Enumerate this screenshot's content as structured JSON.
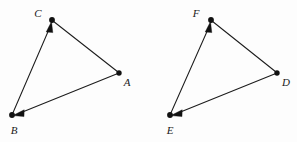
{
  "figure": {
    "background_color": "#fdfdfd",
    "stroke_color": "#1c1c1c",
    "label_color": "#1a1a1a",
    "width": 297,
    "height": 142
  },
  "triangles": [
    {
      "name": "triangle-abc",
      "vertices": [
        {
          "id": "A",
          "label": "A",
          "x": 119,
          "y": 73,
          "label_x": 127,
          "label_y": 82
        },
        {
          "id": "B",
          "label": "B",
          "x": 12,
          "y": 115,
          "label_x": 14,
          "label_y": 130
        },
        {
          "id": "C",
          "label": "C",
          "x": 52,
          "y": 20,
          "label_x": 38,
          "label_y": 13
        }
      ],
      "edges": [
        {
          "name": "edge-b-to-c",
          "from": "B",
          "to": "C",
          "arrow_at": "C"
        },
        {
          "name": "edge-c-to-a",
          "from": "C",
          "to": "A",
          "arrow_at": "none"
        },
        {
          "name": "edge-a-to-b",
          "from": "A",
          "to": "B",
          "arrow_at": "B"
        }
      ]
    },
    {
      "name": "triangle-def",
      "vertices": [
        {
          "id": "D",
          "label": "D",
          "x": 277,
          "y": 73,
          "label_x": 286,
          "label_y": 82
        },
        {
          "id": "E",
          "label": "E",
          "x": 170,
          "y": 115,
          "label_x": 170,
          "label_y": 130
        },
        {
          "id": "F",
          "label": "F",
          "x": 211,
          "y": 20,
          "label_x": 196,
          "label_y": 13
        }
      ],
      "edges": [
        {
          "name": "edge-e-to-f",
          "from": "E",
          "to": "F",
          "arrow_at": "F"
        },
        {
          "name": "edge-f-to-d",
          "from": "F",
          "to": "D",
          "arrow_at": "none"
        },
        {
          "name": "edge-d-to-e",
          "from": "D",
          "to": "E",
          "arrow_at": "E"
        }
      ]
    }
  ]
}
